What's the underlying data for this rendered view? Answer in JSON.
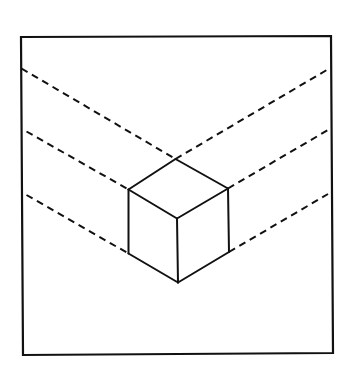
{
  "diagram": {
    "canvas": {
      "width": 354,
      "height": 375,
      "background": "#ffffff"
    },
    "stroke_color": "#111111",
    "frame": {
      "top_left": [
        21,
        37
      ],
      "top_right": [
        331,
        36
      ],
      "bottom_right": [
        333,
        353
      ],
      "bottom_left": [
        23,
        355
      ]
    },
    "cube": {
      "vertices": {
        "top": [
          175.5,
          159
        ],
        "left_top": [
          128.5,
          189.5
        ],
        "right_top": [
          228,
          188.5
        ],
        "center": [
          177,
          218.5
        ],
        "left_bottom": [
          128.5,
          253.5
        ],
        "right_bottom": [
          229,
          252
        ],
        "bottom": [
          178,
          282.5
        ]
      },
      "edges": [
        [
          "top",
          "left_top"
        ],
        [
          "top",
          "right_top"
        ],
        [
          "left_top",
          "center"
        ],
        [
          "right_top",
          "center"
        ],
        [
          "left_top",
          "left_bottom"
        ],
        [
          "right_top",
          "right_bottom"
        ],
        [
          "center",
          "bottom"
        ],
        [
          "left_bottom",
          "bottom"
        ],
        [
          "right_bottom",
          "bottom"
        ]
      ]
    },
    "dashed_lines": [
      {
        "name": "upper-left",
        "from": [
          21.5,
          68.5
        ],
        "to": [
          175.5,
          159
        ]
      },
      {
        "name": "upper-right",
        "from": [
          175.5,
          159
        ],
        "to": [
          331,
          67.5
        ]
      },
      {
        "name": "middle-left",
        "from": [
          26.5,
          131.5
        ],
        "to": [
          128.5,
          189.5
        ]
      },
      {
        "name": "middle-right",
        "from": [
          228,
          188.5
        ],
        "to": [
          328,
          130
        ]
      },
      {
        "name": "lower-left",
        "from": [
          26.5,
          195
        ],
        "to": [
          128.5,
          253.5
        ]
      },
      {
        "name": "lower-right",
        "from": [
          229,
          252
        ],
        "to": [
          328,
          194
        ]
      }
    ],
    "dash_pattern": "7 5"
  }
}
